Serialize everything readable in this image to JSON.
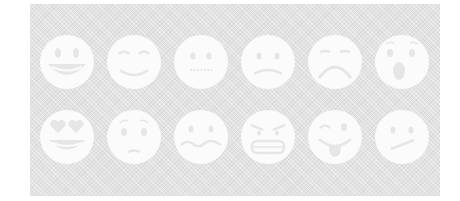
{
  "panel": {
    "background": "#e2e2e2",
    "face_color": "#fbfbfb",
    "feature_color": "#e4e4e4"
  },
  "emojis": [
    {
      "name": "grinning-face-with-big-eyes",
      "row": 0,
      "col": 0
    },
    {
      "name": "smiling-face-closed-eyes",
      "row": 0,
      "col": 1
    },
    {
      "name": "neutral-face-zipped",
      "row": 0,
      "col": 2
    },
    {
      "name": "slightly-frowning-face",
      "row": 0,
      "col": 3
    },
    {
      "name": "frowning-face-closed-eyes",
      "row": 0,
      "col": 4
    },
    {
      "name": "face-open-mouth-surprised",
      "row": 0,
      "col": 5
    },
    {
      "name": "heart-eyes-grinning-face",
      "row": 1,
      "col": 0
    },
    {
      "name": "worried-face",
      "row": 1,
      "col": 1
    },
    {
      "name": "confounded-wavy-mouth-face",
      "row": 1,
      "col": 2
    },
    {
      "name": "angry-grimacing-face",
      "row": 1,
      "col": 3
    },
    {
      "name": "winking-face-tongue-out",
      "row": 1,
      "col": 4
    },
    {
      "name": "confused-face",
      "row": 1,
      "col": 5
    }
  ]
}
